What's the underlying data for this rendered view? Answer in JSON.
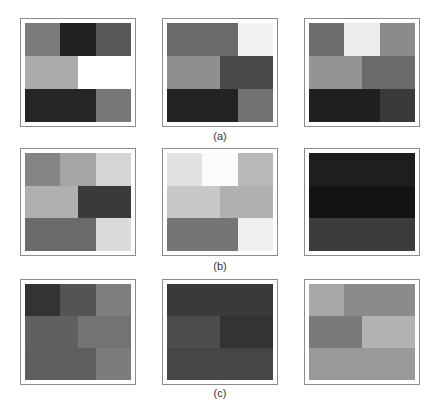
{
  "figure": {
    "groups": [
      {
        "caption": "(a)",
        "panels": [
          {
            "rows": [
              [
                {
                  "w": 1,
                  "color": "#7c7c7c"
                },
                {
                  "w": 1,
                  "color": "#222222"
                },
                {
                  "w": 1,
                  "color": "#575757"
                }
              ],
              [
                {
                  "w": 1.5,
                  "color": "#ababab"
                },
                {
                  "w": 1.5,
                  "color": "#ffffff"
                }
              ],
              [
                {
                  "w": 2,
                  "color": "#252525"
                },
                {
                  "w": 1,
                  "color": "#777777"
                }
              ]
            ]
          },
          {
            "rows": [
              [
                {
                  "w": 2,
                  "color": "#6a6a6a"
                },
                {
                  "w": 1,
                  "color": "#f2f2f2"
                }
              ],
              [
                {
                  "w": 1.5,
                  "color": "#8f8f8f"
                },
                {
                  "w": 1.5,
                  "color": "#4a4a4a"
                }
              ],
              [
                {
                  "w": 2,
                  "color": "#232323"
                },
                {
                  "w": 1,
                  "color": "#727272"
                }
              ]
            ]
          },
          {
            "rows": [
              [
                {
                  "w": 1,
                  "color": "#6e6e6e"
                },
                {
                  "w": 1,
                  "color": "#ececec"
                },
                {
                  "w": 1,
                  "color": "#8a8a8a"
                }
              ],
              [
                {
                  "w": 1.5,
                  "color": "#949494"
                },
                {
                  "w": 1.5,
                  "color": "#6a6a6a"
                }
              ],
              [
                {
                  "w": 2,
                  "color": "#1f1f1f"
                },
                {
                  "w": 1,
                  "color": "#3a3a3a"
                }
              ]
            ]
          }
        ]
      },
      {
        "caption": "(b)",
        "panels": [
          {
            "rows": [
              [
                {
                  "w": 1,
                  "color": "#858585"
                },
                {
                  "w": 1,
                  "color": "#a5a5a5"
                },
                {
                  "w": 1,
                  "color": "#d5d5d5"
                }
              ],
              [
                {
                  "w": 1.5,
                  "color": "#b0b0b0"
                },
                {
                  "w": 1.5,
                  "color": "#3a3a3a"
                }
              ],
              [
                {
                  "w": 2,
                  "color": "#6a6a6a"
                },
                {
                  "w": 1,
                  "color": "#dadada"
                }
              ]
            ]
          },
          {
            "rows": [
              [
                {
                  "w": 1,
                  "color": "#e2e2e2"
                },
                {
                  "w": 1,
                  "color": "#fbfbfb"
                },
                {
                  "w": 1,
                  "color": "#b8b8b8"
                }
              ],
              [
                {
                  "w": 1.5,
                  "color": "#c8c8c8"
                },
                {
                  "w": 1.5,
                  "color": "#b0b0b0"
                }
              ],
              [
                {
                  "w": 2,
                  "color": "#757575"
                },
                {
                  "w": 1,
                  "color": "#efefef"
                }
              ]
            ]
          },
          {
            "rows": [
              [
                {
                  "w": 3,
                  "color": "#1e1e1e"
                }
              ],
              [
                {
                  "w": 3,
                  "color": "#141414"
                }
              ],
              [
                {
                  "w": 3,
                  "color": "#3c3c3c"
                }
              ]
            ]
          }
        ]
      },
      {
        "caption": "(c)",
        "panels": [
          {
            "rows": [
              [
                {
                  "w": 1,
                  "color": "#333333"
                },
                {
                  "w": 1,
                  "color": "#545454"
                },
                {
                  "w": 1,
                  "color": "#7e7e7e"
                }
              ],
              [
                {
                  "w": 1.5,
                  "color": "#606060"
                },
                {
                  "w": 1.5,
                  "color": "#737373"
                }
              ],
              [
                {
                  "w": 2,
                  "color": "#5e5e5e"
                },
                {
                  "w": 1,
                  "color": "#7c7c7c"
                }
              ]
            ]
          },
          {
            "rows": [
              [
                {
                  "w": 3,
                  "color": "#3a3a3a"
                }
              ],
              [
                {
                  "w": 1.5,
                  "color": "#4c4c4c"
                },
                {
                  "w": 1.5,
                  "color": "#333333"
                }
              ],
              [
                {
                  "w": 3,
                  "color": "#464646"
                }
              ]
            ]
          },
          {
            "rows": [
              [
                {
                  "w": 1,
                  "color": "#a8a8a8"
                },
                {
                  "w": 2,
                  "color": "#8a8a8a"
                }
              ],
              [
                {
                  "w": 1.5,
                  "color": "#7a7a7a"
                },
                {
                  "w": 1.5,
                  "color": "#b2b2b2"
                }
              ],
              [
                {
                  "w": 3,
                  "color": "#999999"
                }
              ]
            ]
          }
        ]
      }
    ]
  }
}
